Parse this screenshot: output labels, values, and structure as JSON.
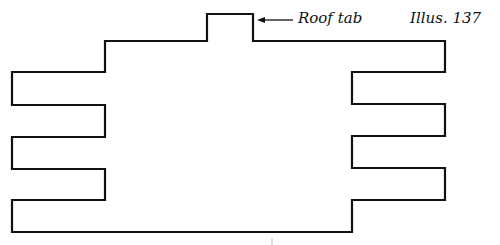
{
  "diagram": {
    "illustration_label": "Illus. 137",
    "annotations": [
      {
        "text": "Roof tab",
        "points_to": "roof-tab"
      }
    ],
    "shape": {
      "description": "Flat pattern outline with a roof tab on top and three side tabs on each side",
      "stroke_color": "#111111",
      "left_tabs": 3,
      "right_tabs": 3,
      "roof_tabs": 1
    }
  }
}
